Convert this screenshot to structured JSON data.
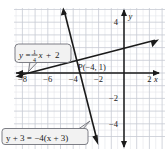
{
  "figure": {
    "type": "coordinate-plane-graph",
    "background_color": "#ffffff",
    "grid_color": "#d6d8e0",
    "grid_major_color": "#b9bcc6",
    "axis_color": "#1a1a1a",
    "line_color": "#1a1a1a",
    "callout_fill": "#f2f2f2",
    "callout_border": "#6f7178"
  },
  "axes": {
    "x_label": "x",
    "y_label": "y",
    "x_ticks": [
      "−8",
      "−6",
      "−4",
      "−2",
      "2"
    ],
    "x_tick_values": [
      -8,
      -6,
      -4,
      -2,
      2
    ],
    "y_ticks": [
      "4",
      "−2",
      "−4"
    ],
    "y_tick_values": [
      4,
      -2,
      -4
    ],
    "x_range": [
      -8.7,
      3.0
    ],
    "y_range": [
      -5.4,
      5.6
    ],
    "grid_step": 0.5
  },
  "callouts": {
    "line1_label": "y = ¼x + 2",
    "line1_label_parts": {
      "lhs": "y",
      "equals": "=",
      "frac_num": "1",
      "frac_den": "4",
      "var": "x",
      "plus": "+",
      "const": "2"
    },
    "line2_label": "y + 3 = −4(x + 3)"
  },
  "point": {
    "name": "P",
    "label": "P(−4, 1)",
    "x": -4,
    "y": 1
  },
  "chart_data": {
    "type": "line",
    "title": "",
    "xlabel": "x",
    "ylabel": "y",
    "xlim": [
      -8.7,
      3.0
    ],
    "ylim": [
      -5.4,
      5.6
    ],
    "grid": true,
    "legend": "none",
    "series": [
      {
        "name": "y = 1/4 x + 2",
        "equation": "y = (1/4)x + 2",
        "slope": 0.25,
        "intercept": 2,
        "x": [
          -8.7,
          3.0
        ],
        "values": [
          -0.175,
          2.75
        ],
        "arrows": "both"
      },
      {
        "name": "y + 3 = -4(x + 3)",
        "equation": "y = -4x - 15",
        "slope": -4,
        "intercept": -15,
        "x": [
          -4.7,
          -2.6
        ],
        "values": [
          3.8,
          -4.6
        ],
        "arrows": "both"
      }
    ],
    "annotations": [
      {
        "text": "P(−4, 1)",
        "x": -4,
        "y": 1,
        "type": "point-label"
      },
      {
        "text": "y = ¼x + 2",
        "x": -7.0,
        "y": 3.0,
        "type": "callout"
      },
      {
        "text": "y + 3 = −4(x + 3)",
        "x": -8.2,
        "y": -4.6,
        "type": "callout"
      }
    ]
  }
}
